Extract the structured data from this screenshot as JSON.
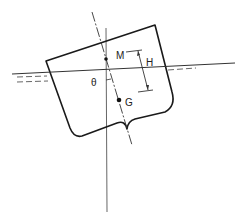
{
  "diagram": {
    "labels": {
      "metacenter": "M",
      "center_of_gravity": "G",
      "metacentric_height": "H",
      "heel_angle": "θ"
    },
    "colors": {
      "line": "#1a1a1a",
      "thin_line": "#555555",
      "background": "#ffffff"
    }
  }
}
